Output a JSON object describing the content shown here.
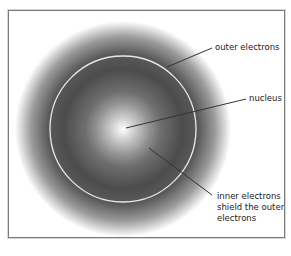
{
  "diagram": {
    "labels": {
      "outer_electrons": "outer electrons",
      "nucleus": "nucleus",
      "inner_electrons_line1": "inner electrons",
      "inner_electrons_line2": "shield the outer",
      "inner_electrons_line3": "electrons"
    },
    "colors": {
      "frame": "#7a7a7a",
      "haze_dark": "#4a4a4a",
      "ring": "#e8e8e8",
      "leader_line": "#333333",
      "text": "#222222"
    }
  }
}
